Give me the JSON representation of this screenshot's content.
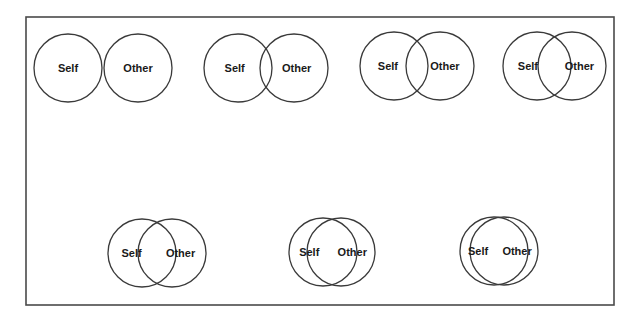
{
  "figure": {
    "title": "",
    "frame": {
      "x": 26,
      "y": 17,
      "width": 588,
      "height": 288,
      "stroke": "#4a4a4a"
    },
    "circle_radius": 34,
    "pairs": [
      {
        "id": 1,
        "row": 1,
        "self": {
          "label": "Self",
          "cx": 68,
          "cy": 68
        },
        "other": {
          "label": "Other",
          "cx": 138,
          "cy": 68
        },
        "overlap": "none"
      },
      {
        "id": 2,
        "row": 1,
        "self": {
          "label": "Self",
          "cx": 238,
          "cy": 68
        },
        "other": {
          "label": "Other",
          "cx": 294,
          "cy": 68
        },
        "overlap": "small"
      },
      {
        "id": 3,
        "row": 1,
        "self": {
          "label": "Self",
          "cx": 394,
          "cy": 66
        },
        "other": {
          "label": "Other",
          "cx": 440,
          "cy": 66
        },
        "overlap": "some"
      },
      {
        "id": 4,
        "row": 1,
        "self": {
          "label": "Self",
          "cx": 537,
          "cy": 66
        },
        "other": {
          "label": "Other",
          "cx": 572,
          "cy": 66
        },
        "overlap": "equal"
      },
      {
        "id": 5,
        "row": 2,
        "self": {
          "label": "Self",
          "cx": 142,
          "cy": 253
        },
        "other": {
          "label": "Other",
          "cx": 172,
          "cy": 253
        },
        "overlap": "strong"
      },
      {
        "id": 6,
        "row": 2,
        "self": {
          "label": "Self",
          "cx": 323,
          "cy": 252
        },
        "other": {
          "label": "Other",
          "cx": 341,
          "cy": 252
        },
        "overlap": "very-strong"
      },
      {
        "id": 7,
        "row": 2,
        "self": {
          "label": "Self",
          "cx": 494,
          "cy": 251
        },
        "other": {
          "label": "Other",
          "cx": 504,
          "cy": 251
        },
        "overlap": "most"
      }
    ],
    "labels": {
      "self": "Self",
      "other": "Other"
    },
    "colors": {
      "background": "#ffffff",
      "stroke": "#3a3a3a",
      "text": "#1a1a1a"
    }
  }
}
